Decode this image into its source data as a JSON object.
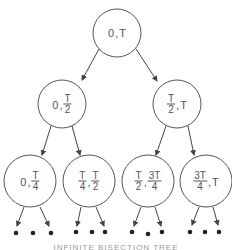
{
  "diagram": {
    "title": "Infinite bisection tree",
    "caption": "INFINITE BISECTION TREE",
    "nodes": {
      "root": {
        "a": "0",
        "b": "T"
      },
      "l": {
        "a": "0",
        "b_num": "T",
        "b_den": "2"
      },
      "r": {
        "a_num": "T",
        "a_den": "2",
        "b": "T"
      },
      "ll": {
        "a": "0",
        "b_num": "T",
        "b_den": "4"
      },
      "lr": {
        "a_num": "T",
        "a_den": "4",
        "b_num": "T",
        "b_den": "2"
      },
      "rl": {
        "a_num": "T",
        "a_den": "2",
        "b_num": "3T",
        "b_den": "4"
      },
      "rr": {
        "a_num": "3T",
        "a_den": "4",
        "b": "T"
      }
    },
    "separator": ",",
    "continuation": "• • •"
  }
}
